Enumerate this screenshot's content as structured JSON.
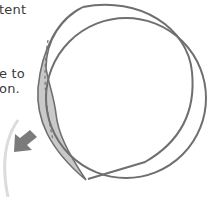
{
  "caption": {
    "line1": "tent",
    "line2": "e to",
    "line3": "on."
  },
  "diagram": {
    "colors": {
      "outline": "#6f6f6f",
      "crescent_fill": "#c9c9c9",
      "dashed_line": "#7a7a7a",
      "faint_arc": "#dcdcdc",
      "arrow": "#7b7b7b",
      "text": "#3a3a3a",
      "background": "#ffffff"
    },
    "icons": {
      "arrow": "arrow-down-left-icon"
    }
  }
}
